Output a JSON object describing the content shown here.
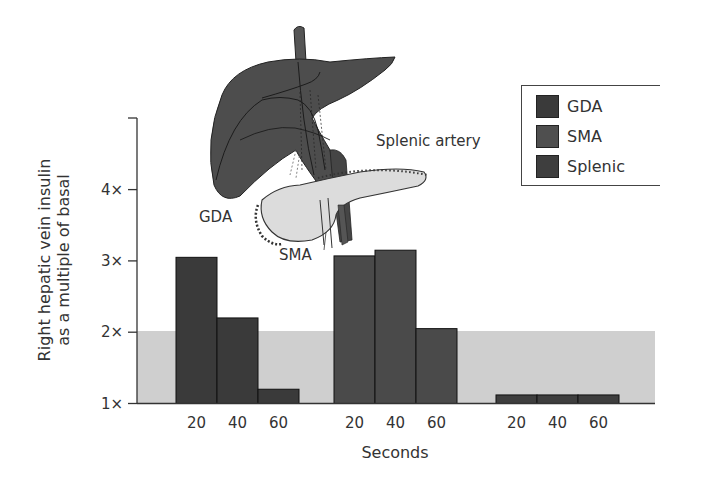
{
  "chart_data": {
    "type": "bar",
    "title": "",
    "xlabel": "Seconds",
    "ylabel": "Right hepatic vein insulin as a multiple of basal",
    "ylabel_lines": [
      "Right hepatic vein insulin",
      "as a multiple of basal"
    ],
    "ylim": [
      1,
      5
    ],
    "yticks": [
      1,
      2,
      3,
      4
    ],
    "ytick_labels": [
      "1×",
      "2×",
      "3×",
      "4×"
    ],
    "categories": [
      "20",
      "40",
      "60"
    ],
    "series": [
      {
        "name": "GDA",
        "color": "#3a3a3a",
        "values": [
          3.05,
          2.2,
          1.2
        ]
      },
      {
        "name": "SMA",
        "color": "#4a4a4a",
        "values": [
          3.07,
          3.15,
          2.05
        ]
      },
      {
        "name": "Splenic",
        "color": "#3e3e3e",
        "values": [
          1.12,
          1.12,
          1.12
        ]
      }
    ],
    "reference_band": {
      "from": 1,
      "to": 2,
      "color": "#cfcfcf"
    },
    "grid": false,
    "legend_position": "top-right",
    "annotations": [
      "GDA",
      "SMA",
      "Splenic artery"
    ]
  },
  "legend": {
    "items": [
      {
        "label": "GDA",
        "color": "#3a3a3a"
      },
      {
        "label": "SMA",
        "color": "#4f4f4f"
      },
      {
        "label": "Splenic",
        "color": "#3e3e3e"
      }
    ]
  },
  "illustration": {
    "labels": {
      "gda": "GDA",
      "sma": "SMA",
      "splenic": "Splenic artery"
    },
    "liver_color": "#4d4d4d",
    "pancreas_color": "#dcdcdc"
  }
}
